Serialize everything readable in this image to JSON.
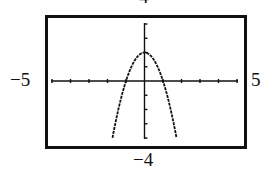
{
  "window": {
    "xmin_label": "−5",
    "xmax_label": "5",
    "ymin_label": "−4",
    "ymax_label": "4"
  },
  "colors": {
    "frame": "#111111",
    "axis": "#111111",
    "curve": "#111111",
    "background": "#ffffff"
  },
  "chart_data": {
    "type": "line",
    "title": "",
    "xlabel": "",
    "ylabel": "",
    "xlim": [
      -5,
      5
    ],
    "ylim": [
      -4,
      4
    ],
    "xscale_tick": 1,
    "yscale_tick": 1,
    "grid": false,
    "legend": null,
    "style": "graphing-calculator window, dotted/pixelated curve",
    "series": [
      {
        "name": "y = 2 - 2x^2",
        "x": [
          -1.73,
          -1.5,
          -1.25,
          -1.0,
          -0.75,
          -0.5,
          -0.25,
          0,
          0.25,
          0.5,
          0.75,
          1.0,
          1.25,
          1.5,
          1.73
        ],
        "y": [
          -3.99,
          -2.5,
          -1.125,
          0,
          0.875,
          1.5,
          1.875,
          2,
          1.875,
          1.5,
          0.875,
          0,
          -1.125,
          -2.5,
          -3.99
        ]
      }
    ],
    "annotations": {
      "vertex": [
        0,
        2
      ],
      "x_intercepts": [
        -1,
        1
      ]
    }
  }
}
